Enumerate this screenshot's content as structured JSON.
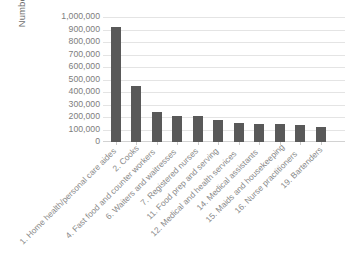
{
  "chart_data": {
    "type": "bar",
    "title": "",
    "subtitle": "",
    "xlabel": "",
    "ylabel": "Number of New Jobs",
    "ylim": [
      0,
      1000000
    ],
    "grid": true,
    "legend": false,
    "orientation": "vertical",
    "bar_color": "#595959",
    "gridline_color": "#e4e4e4",
    "categories": [
      "1. Home health/personal care aides",
      "2. Cooks",
      "4. Fast food and counter workers",
      "6. Waiters and waitresses",
      "7. Registered nurses",
      "11. Food prep and serving",
      "12. Medical and health services",
      "14. Medical assistants",
      "15. Maids and housekeeping",
      "16. Nurse practitioners",
      "19. Bartenders"
    ],
    "values": [
      924000,
      452000,
      242000,
      208000,
      205000,
      173000,
      151000,
      146000,
      142000,
      137000,
      120000
    ],
    "ytick_labels": [
      "1,000,000",
      "900,000",
      "800,000",
      "700,000",
      "600,000",
      "500,000",
      "400,000",
      "300,000",
      "200,000",
      "100,000",
      "0"
    ],
    "ytick_values": [
      1000000,
      900000,
      800000,
      700000,
      600000,
      500000,
      400000,
      300000,
      200000,
      100000,
      0
    ]
  }
}
